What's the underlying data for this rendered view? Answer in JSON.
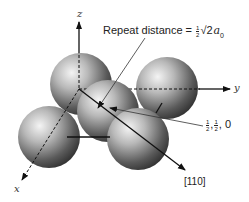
{
  "diagram": {
    "axes": {
      "x_label": "x",
      "y_label": "y",
      "z_label": "z"
    },
    "annotations": {
      "repeat_distance_prefix": "Repeat distance = ",
      "repeat_distance_frac_num": "1",
      "repeat_distance_frac_den": "2",
      "repeat_distance_root": "√2",
      "repeat_distance_symbol": "a",
      "repeat_distance_subscript": "0",
      "position_frac1_num": "1",
      "position_frac1_den": "2",
      "position_frac2_num": "1",
      "position_frac2_den": "2",
      "position_last": "0",
      "direction_label": "[110]"
    },
    "spheres": [
      {
        "name": "top-left",
        "cx": 81,
        "cy": 84,
        "r": 31
      },
      {
        "name": "top-right",
        "cx": 167,
        "cy": 88,
        "r": 31
      },
      {
        "name": "center",
        "cx": 108,
        "cy": 111,
        "r": 31
      },
      {
        "name": "bottom-left",
        "cx": 49,
        "cy": 137,
        "r": 31
      },
      {
        "name": "bottom-right",
        "cx": 138,
        "cy": 139,
        "r": 31
      }
    ],
    "colors": {
      "sphere_light": "#f2f2f2",
      "sphere_dark": "#3a3a3a",
      "line": "#111111"
    }
  }
}
